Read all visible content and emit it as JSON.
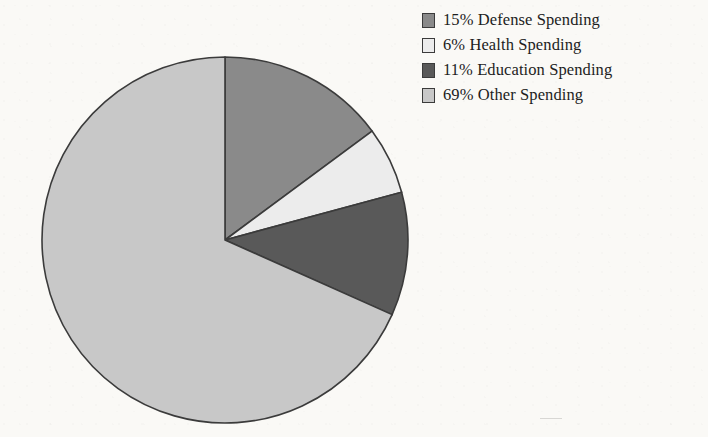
{
  "figure": {
    "background_color": "#faf9f6",
    "outline_color": "#3b3b3b"
  },
  "legend": {
    "position": "top-right",
    "items": [
      {
        "label": "15% Defense Spending",
        "percent": 15,
        "name": "Defense Spending",
        "color": "#8a8a8a"
      },
      {
        "label": "6% Health Spending",
        "percent": 6,
        "name": "Health Spending",
        "color": "#ececec"
      },
      {
        "label": "11% Education Spending",
        "percent": 11,
        "name": "Education Spending",
        "color": "#595959"
      },
      {
        "label": "69% Other Spending",
        "percent": 69,
        "name": "Other Spending",
        "color": "#c8c8c8"
      }
    ]
  },
  "chart_data": {
    "type": "pie",
    "title": "",
    "xlabel": "",
    "ylabel": "",
    "grid": false,
    "legend_position": "top-right",
    "start_angle_deg": 0,
    "direction": "clockwise",
    "center": {
      "x": 225,
      "y": 240
    },
    "radius": 183,
    "categories": [
      "Defense Spending",
      "Health Spending",
      "Education Spending",
      "Other Spending"
    ],
    "values": [
      15,
      6,
      11,
      69
    ],
    "labels": [
      "15% Defense Spending",
      "6% Health Spending",
      "11% Education Spending",
      "69% Other Spending"
    ],
    "colors": [
      "#8a8a8a",
      "#ececec",
      "#595959",
      "#c8c8c8"
    ],
    "units": "percent",
    "total": 101
  }
}
